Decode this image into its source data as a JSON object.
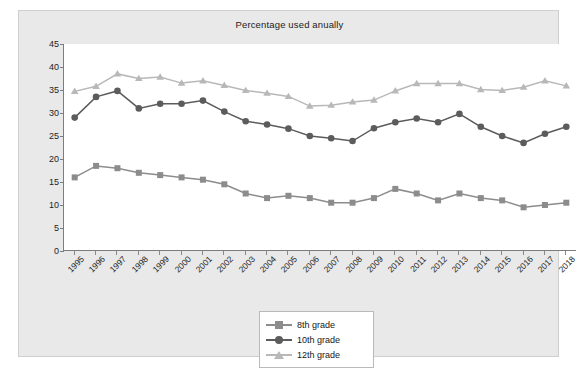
{
  "chart_data": {
    "type": "line",
    "title": "Percentage used anually",
    "xlabel": "",
    "ylabel": "",
    "ylim": [
      0,
      45
    ],
    "yticks": [
      0,
      5,
      10,
      15,
      20,
      25,
      30,
      35,
      40,
      45
    ],
    "grid": false,
    "legend_position": "bottom-center",
    "categories": [
      "1995",
      "1996",
      "1997",
      "1998",
      "1999",
      "2000",
      "2001",
      "2002",
      "2003",
      "2004",
      "2005",
      "2006",
      "2007",
      "2008",
      "2009",
      "2010",
      "2011",
      "2012",
      "2013",
      "2014",
      "2015",
      "2016",
      "2017",
      "2018"
    ],
    "series": [
      {
        "name": "8th grade",
        "marker": "square",
        "color": "#8c8c8c",
        "values": [
          16.0,
          18.5,
          18.0,
          17.0,
          16.5,
          16.0,
          15.5,
          14.5,
          12.5,
          11.5,
          12.0,
          11.5,
          10.5,
          10.5,
          11.5,
          13.5,
          12.5,
          11.0,
          12.5,
          11.5,
          11.0,
          9.5,
          10.0,
          10.5
        ]
      },
      {
        "name": "10th grade",
        "marker": "circle",
        "color": "#5c5c5c",
        "values": [
          29.0,
          33.5,
          34.8,
          31.0,
          32.0,
          32.0,
          32.7,
          30.3,
          28.2,
          27.5,
          26.6,
          25.0,
          24.5,
          23.9,
          26.7,
          28.0,
          28.8,
          28.0,
          29.8,
          27.0,
          25.0,
          23.5,
          25.5,
          27.0
        ]
      },
      {
        "name": "12th grade",
        "marker": "triangle",
        "color": "#b8b8b8",
        "values": [
          34.7,
          35.8,
          38.5,
          37.5,
          37.8,
          36.5,
          37.0,
          36.0,
          34.9,
          34.3,
          33.6,
          31.5,
          31.7,
          32.4,
          32.8,
          34.8,
          36.4,
          36.4,
          36.4,
          35.1,
          34.9,
          35.6,
          37.0,
          35.9
        ]
      }
    ]
  },
  "panel": {
    "background_color": "#e9e9e9",
    "plot_background_color": "#ffffff",
    "axis_color": "#7d7d7d"
  }
}
